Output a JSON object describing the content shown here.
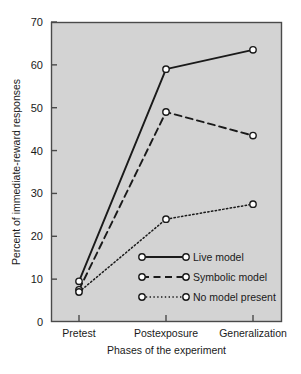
{
  "chart_data": {
    "type": "line",
    "title": "",
    "subtitle": "",
    "xlabel": "Phases of the experiment",
    "ylabel": "Percent of immediate-reward responses",
    "categories": [
      "Pretest",
      "Postexposure",
      "Generalization"
    ],
    "series": [
      {
        "name": "Live model",
        "values": [
          9.5,
          59.0,
          63.5
        ],
        "style": "solid",
        "marker": "open-circle"
      },
      {
        "name": "Symbolic model",
        "values": [
          7.5,
          49.0,
          43.5
        ],
        "style": "dashed",
        "marker": "open-circle"
      },
      {
        "name": "No model present",
        "values": [
          7.0,
          24.0,
          27.5
        ],
        "style": "dotted",
        "marker": "open-circle"
      }
    ],
    "ylim": [
      0,
      70
    ],
    "yticks": [
      0,
      10,
      20,
      30,
      40,
      50,
      60,
      70
    ],
    "ytick_labels": [
      "0",
      "10",
      "20",
      "30",
      "40",
      "50",
      "60",
      "70"
    ],
    "grid": false,
    "legend_position": "inside-lower-center",
    "colors": {
      "plot_background": "#d3d3d3",
      "figure_background": "#ffffff",
      "axis": "#4a4a4a",
      "line": "#1a1a1a",
      "marker_fill": "#ffffff",
      "text": "#1a1a1a"
    }
  },
  "legend": {
    "entries": [
      {
        "label": "Live model"
      },
      {
        "label": "Symbolic model"
      },
      {
        "label": "No model present"
      }
    ]
  }
}
